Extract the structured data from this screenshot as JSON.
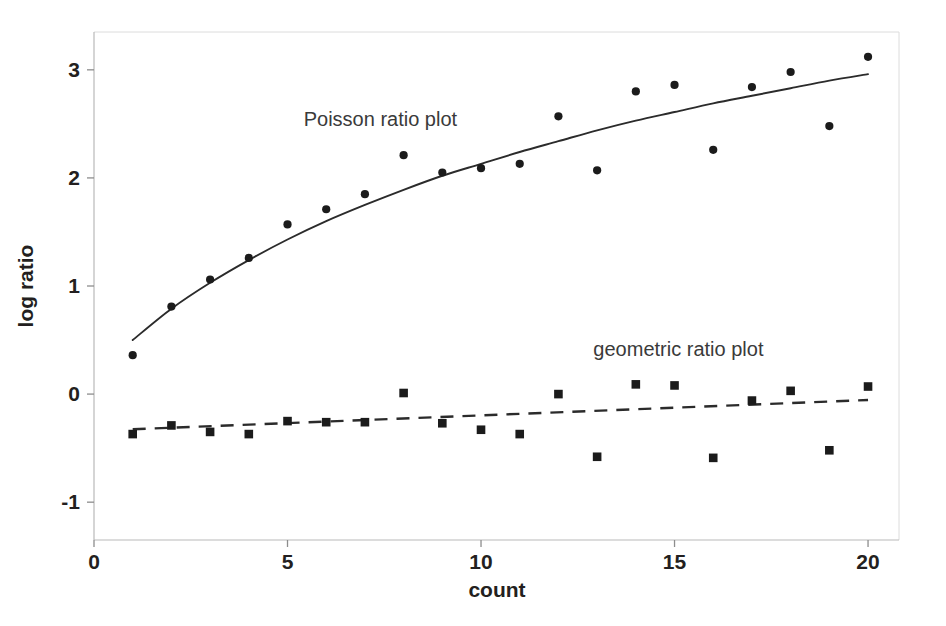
{
  "chart_data": {
    "type": "scatter",
    "title": "",
    "xlabel": "count",
    "ylabel": "log ratio",
    "xlim": [
      0,
      20.8
    ],
    "ylim": [
      -1.35,
      3.35
    ],
    "xticks": [
      "0",
      "5",
      "10",
      "15",
      "20"
    ],
    "xtick_values": [
      0,
      5,
      10,
      15,
      20
    ],
    "yticks": [
      "-1",
      "0",
      "1",
      "2",
      "3"
    ],
    "ytick_values": [
      -1,
      0,
      1,
      2,
      3
    ],
    "grid": false,
    "legend_position": "inline-annotation",
    "x": [
      1,
      2,
      3,
      4,
      5,
      6,
      7,
      8,
      9,
      10,
      11,
      12,
      13,
      14,
      15,
      16,
      17,
      18,
      19,
      20
    ],
    "series": [
      {
        "name": "Poisson ratio plot",
        "marker": "circle",
        "annotation": "Poisson ratio plot",
        "annotation_x": 7.4,
        "annotation_y": 2.48,
        "values": [
          0.36,
          0.81,
          1.06,
          1.26,
          1.57,
          1.71,
          1.85,
          2.21,
          2.05,
          2.09,
          2.13,
          2.57,
          2.07,
          2.8,
          2.86,
          2.26,
          2.84,
          2.98,
          2.48,
          3.12
        ],
        "fit": {
          "style": "solid",
          "x": [
            1,
            2,
            3,
            4,
            5,
            6,
            7,
            8,
            9,
            10,
            11,
            12,
            13,
            14,
            15,
            16,
            17,
            18,
            19,
            20
          ],
          "y": [
            0.5,
            0.79,
            1.03,
            1.24,
            1.43,
            1.6,
            1.75,
            1.89,
            2.02,
            2.13,
            2.24,
            2.34,
            2.44,
            2.53,
            2.61,
            2.69,
            2.76,
            2.83,
            2.9,
            2.96
          ]
        }
      },
      {
        "name": "geometric ratio plot",
        "marker": "square",
        "annotation": "geometric ratio plot",
        "annotation_x": 15.1,
        "annotation_y": 0.35,
        "values": [
          -0.37,
          -0.29,
          -0.35,
          -0.37,
          -0.25,
          -0.26,
          -0.26,
          0.01,
          -0.27,
          -0.33,
          -0.37,
          0.0,
          -0.58,
          0.09,
          0.08,
          -0.59,
          -0.06,
          0.03,
          -0.52,
          0.07
        ],
        "fit": {
          "style": "dashed",
          "x": [
            1,
            20
          ],
          "y": [
            -0.325,
            -0.055
          ]
        }
      }
    ]
  },
  "colors": {
    "ink": "#1b1b1b",
    "axis": "#b9b9b9",
    "frame": "#dcdcdc",
    "annotation": "#3a3a3a",
    "background": "#ffffff"
  }
}
